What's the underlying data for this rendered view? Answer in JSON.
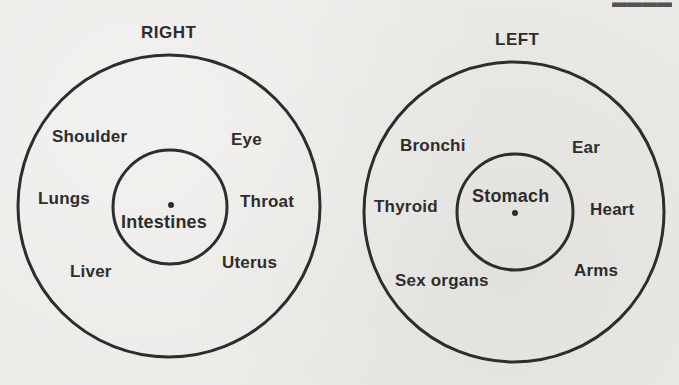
{
  "diagram": {
    "type": "concentric-circles-pair",
    "stroke_color": "#2d2d2d",
    "background_color": "#ebeae7",
    "panels": [
      {
        "id": "right",
        "title": "RIGHT",
        "outer_circle": {
          "cx": 169,
          "cy": 206,
          "r": 151
        },
        "inner_circle": {
          "cx": 170,
          "cy": 207,
          "r": 57
        },
        "center_dot": {
          "cx": 171,
          "cy": 205
        },
        "inner_label": "Intestines",
        "outer_labels": [
          {
            "text": "Shoulder",
            "position": "upper-left"
          },
          {
            "text": "Eye",
            "position": "upper-right"
          },
          {
            "text": "Lungs",
            "position": "left"
          },
          {
            "text": "Throat",
            "position": "right"
          },
          {
            "text": "Liver",
            "position": "lower-left"
          },
          {
            "text": "Uterus",
            "position": "lower-right"
          }
        ]
      },
      {
        "id": "left",
        "title": "LEFT",
        "outer_circle": {
          "cx": 514,
          "cy": 212,
          "r": 150
        },
        "inner_circle": {
          "cx": 515,
          "cy": 212,
          "r": 58
        },
        "center_dot": {
          "cx": 515,
          "cy": 213
        },
        "inner_label": "Stomach",
        "outer_labels": [
          {
            "text": "Bronchi",
            "position": "upper-left"
          },
          {
            "text": "Ear",
            "position": "upper-right"
          },
          {
            "text": "Thyroid",
            "position": "left"
          },
          {
            "text": "Heart",
            "position": "right"
          },
          {
            "text": "Sex organs",
            "position": "lower-left"
          },
          {
            "text": "Arms",
            "position": "lower-right"
          }
        ]
      }
    ]
  }
}
